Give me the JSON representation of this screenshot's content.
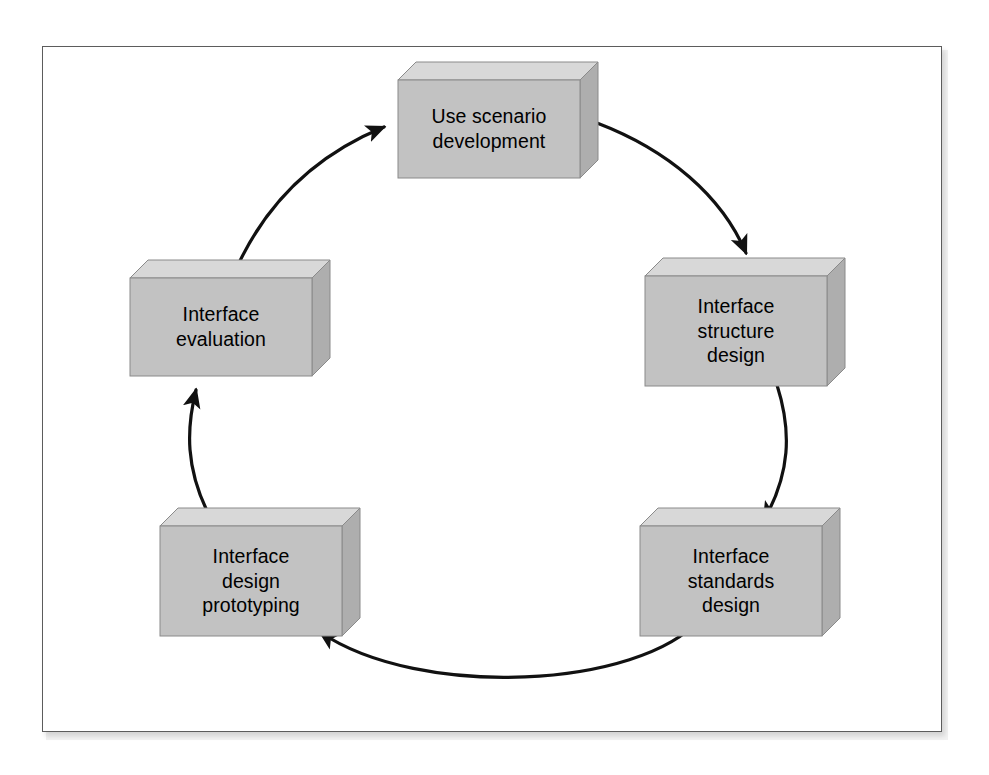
{
  "figure": {
    "kind": "cycle-diagram",
    "title_visible": false,
    "frame": {
      "border_color": "#5c5c5c",
      "background": "#ffffff"
    }
  },
  "style": {
    "box_front_color": "#c0c0c0",
    "box_top_color": "#d8d8d8",
    "box_side_color": "#b0b0b0",
    "box_edge_color": "#8a8a8a",
    "arrow_color": "#111111",
    "text_color": "#000000"
  },
  "nodes": [
    {
      "id": "use-scenario-development",
      "label": "Use scenario\ndevelopment",
      "order": 1,
      "position": "top"
    },
    {
      "id": "interface-structure-design",
      "label": "Interface\nstructure\ndesign",
      "order": 2,
      "position": "right-upper"
    },
    {
      "id": "interface-standards-design",
      "label": "Interface\nstandards\ndesign",
      "order": 3,
      "position": "right-lower"
    },
    {
      "id": "interface-design-prototyping",
      "label": "Interface\ndesign\nprototyping",
      "order": 4,
      "position": "left-lower"
    },
    {
      "id": "interface-evaluation",
      "label": "Interface\nevaluation",
      "order": 5,
      "position": "left-upper"
    }
  ],
  "edges": [
    {
      "id": "edge-1",
      "from": "use-scenario-development",
      "to": "interface-structure-design",
      "direction": "clockwise"
    },
    {
      "id": "edge-2",
      "from": "interface-structure-design",
      "to": "interface-standards-design",
      "direction": "clockwise"
    },
    {
      "id": "edge-3",
      "from": "interface-standards-design",
      "to": "interface-design-prototyping",
      "direction": "clockwise"
    },
    {
      "id": "edge-4",
      "from": "interface-design-prototyping",
      "to": "interface-evaluation",
      "direction": "clockwise"
    },
    {
      "id": "edge-5",
      "from": "interface-evaluation",
      "to": "use-scenario-development",
      "direction": "clockwise"
    }
  ]
}
